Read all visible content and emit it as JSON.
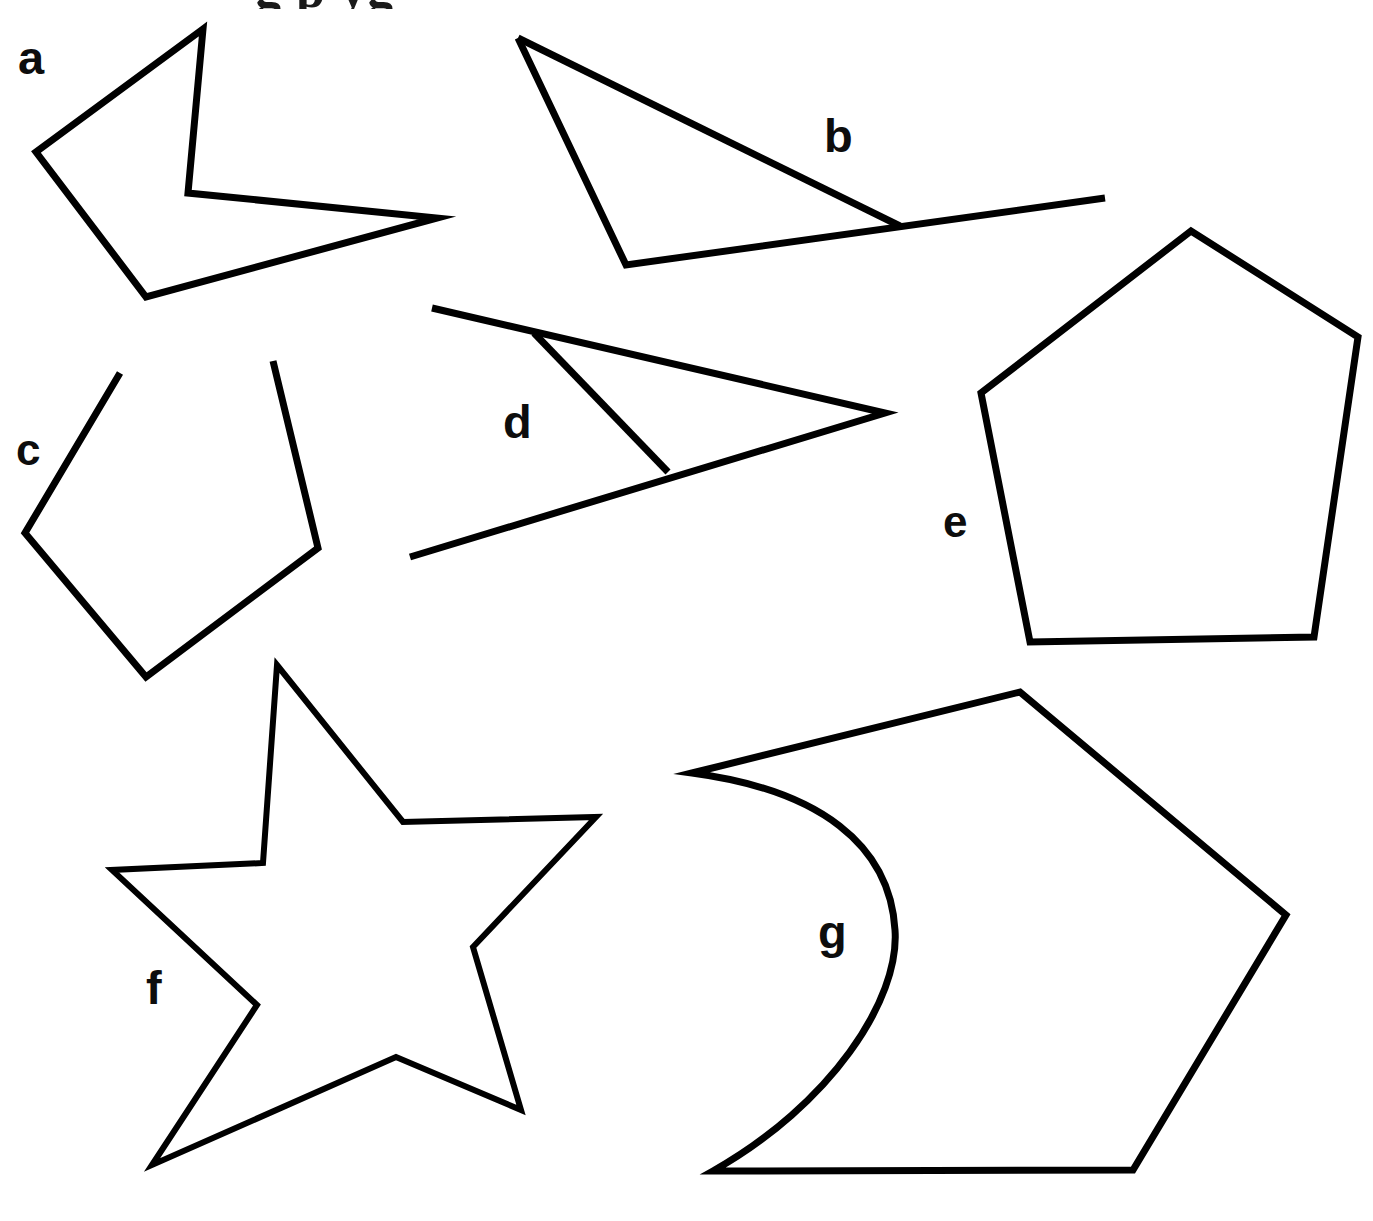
{
  "page": {
    "background_color": "#ffffff",
    "stroke_color": "#000000",
    "width": 1373,
    "height": 1221,
    "clipped_header_text": "g p yg"
  },
  "labels": {
    "a": "a",
    "b": "b",
    "c": "c",
    "d": "d",
    "e": "e",
    "f": "f",
    "g": "g"
  },
  "chart_data": {
    "type": "diagram",
    "stroke_color": "#000000",
    "fill": "none",
    "items": [
      {
        "id": "a",
        "label": "a",
        "label_x": 33,
        "label_y": 57,
        "kind": "closed-polygon",
        "closed": true,
        "vertex_count": 5,
        "convex": false,
        "description": "Non-convex five-sided dart / arrowhead pointing right",
        "points": "203,29 36,152 146,297 437,218 188,193"
      },
      {
        "id": "b",
        "label": "b",
        "label_x": 842,
        "label_y": 136,
        "kind": "open-polyline",
        "closed": false,
        "vertex_count": 4,
        "convex": false,
        "description": "Thin triangle whose base segment overshoots past the right vertex",
        "points": "518,38 626,265 1105,198"
      },
      {
        "id": "b-overshoot-edge",
        "label": "",
        "kind": "open-polyline",
        "closed": false,
        "description": "Edge from apex down to the point where it meets the extended base",
        "points": "518,38 900,226"
      },
      {
        "id": "c",
        "label": "c",
        "label_x": 29,
        "label_y": 451,
        "kind": "open-polyline",
        "closed": false,
        "vertex_count": 5,
        "convex": true,
        "description": "Pentagon-like outline left open along its top edge",
        "points": "120,373 25,533 146,677 318,548 273,361"
      },
      {
        "id": "d",
        "label": "d",
        "label_x": 520,
        "label_y": 425,
        "kind": "open-polyline",
        "closed": false,
        "vertex_count": 5,
        "convex": false,
        "description": "Narrow triangle pointing right with both long sides overshooting to the left",
        "points": "432,308 885,413 410,557"
      },
      {
        "id": "d-crossbar",
        "label": "",
        "kind": "open-polyline",
        "closed": false,
        "description": "Short transversal closing off the narrow triangle near its left end",
        "points": "534,333 668,472"
      },
      {
        "id": "e",
        "label": "e",
        "label_x": 959,
        "label_y": 523,
        "kind": "closed-polygon",
        "closed": true,
        "vertex_count": 5,
        "convex": true,
        "description": "Convex pentagon, slightly irregular",
        "points": "1191,231 981,393 1030,642 1314,637 1358,337"
      },
      {
        "id": "f",
        "label": "f",
        "label_x": 160,
        "label_y": 990,
        "kind": "closed-polygon",
        "closed": true,
        "vertex_count": 10,
        "convex": false,
        "description": "Five-pointed star (decagon outline)",
        "points": "277,665 403,822 596,817 473,947 521,1110 396,1057 152,1165 257,1005 112,870 263,863"
      },
      {
        "id": "g",
        "label": "g",
        "label_x": 836,
        "label_y": 935,
        "kind": "closed-curved",
        "closed": true,
        "vertex_count": 5,
        "convex": false,
        "has_curved_edge": true,
        "description": "Pentagon-like outline whose left side is a concave circular arc bulging inward",
        "path": "M 692,773 L 1020,692 L 1286,915 L 1133,1170 L 713,1171 C 830,1105 900,1000 895,930 C 890,845 820,790 692,773 Z"
      }
    ]
  }
}
